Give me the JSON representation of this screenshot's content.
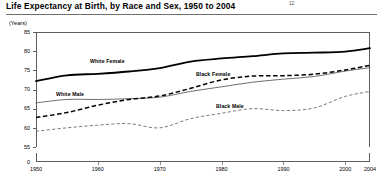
{
  "title": {
    "text": "Life Expectancy at Birth, by Race and Sex, 1950 to 2004",
    "footnote": "12"
  },
  "axis": {
    "units_label": "(Years)",
    "y_ticks": [
      "85",
      "80",
      "75",
      "70",
      "65",
      "60",
      "55",
      "0"
    ],
    "x_ticks": [
      "1950",
      "1960",
      "1970",
      "1980",
      "1990",
      "2000",
      "2004"
    ]
  },
  "series_labels": {
    "white_female": "White Female",
    "white_male": "White Male",
    "black_female": "Black Female",
    "black_male": "Black Male"
  },
  "chart_data": {
    "type": "line",
    "title": "Life Expectancy at Birth, by Race and Sex, 1950 to 2004",
    "xlabel": "",
    "ylabel": "(Years)",
    "xlim": [
      1950,
      2004
    ],
    "ylim": [
      55,
      85
    ],
    "grid": false,
    "legend_position": "inline-annotations",
    "y_axis_break": true,
    "y_tick_values": [
      85,
      80,
      75,
      70,
      65,
      60,
      55,
      0
    ],
    "x_tick_values": [
      1950,
      1960,
      1970,
      1980,
      1990,
      2000,
      2004
    ],
    "x": [
      1950,
      1955,
      1960,
      1965,
      1970,
      1975,
      1980,
      1985,
      1990,
      1995,
      2000,
      2004
    ],
    "series": [
      {
        "name": "White Female",
        "style": "thick-solid",
        "color": "#000000",
        "values": [
          72.2,
          73.7,
          74.1,
          74.7,
          75.6,
          77.3,
          78.1,
          78.7,
          79.4,
          79.6,
          79.9,
          80.8
        ]
      },
      {
        "name": "White Male",
        "style": "thin-solid",
        "color": "#555555",
        "values": [
          66.5,
          67.4,
          67.4,
          67.6,
          68.0,
          69.5,
          70.7,
          71.9,
          72.7,
          73.4,
          74.8,
          75.7
        ]
      },
      {
        "name": "Black Female",
        "style": "dashed",
        "color": "#000000",
        "values": [
          62.7,
          64.0,
          65.9,
          67.4,
          68.3,
          70.3,
          72.5,
          73.5,
          73.6,
          74.0,
          75.1,
          76.3
        ]
      },
      {
        "name": "Black Male",
        "style": "dotted",
        "color": "#7a7a7a",
        "values": [
          59.1,
          60.0,
          60.7,
          61.1,
          60.0,
          62.4,
          63.8,
          65.0,
          64.5,
          65.2,
          68.2,
          69.5
        ]
      }
    ]
  }
}
